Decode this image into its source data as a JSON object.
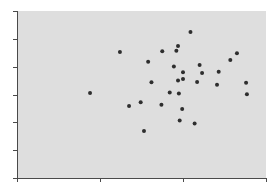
{
  "chart_data": {
    "type": "scatter",
    "title": "",
    "xlabel": "",
    "ylabel": "",
    "xlim": [
      0,
      3
    ],
    "ylim": [
      0,
      6
    ],
    "x_ticks": [
      0,
      1,
      2,
      3
    ],
    "y_ticks": [
      0,
      1,
      2,
      3,
      4,
      5,
      6
    ],
    "x_tick_labels": [],
    "y_tick_labels": [],
    "grid": false,
    "legend": null,
    "colors": {
      "plot_background": "#dedede",
      "axis": "#4a4a4a",
      "marker": "#2e2e2e"
    },
    "series": [
      {
        "name": "points",
        "points": [
          [
            0.88,
            3.05
          ],
          [
            1.24,
            4.53
          ],
          [
            1.35,
            2.59
          ],
          [
            1.49,
            2.72
          ],
          [
            1.53,
            1.69
          ],
          [
            1.58,
            4.18
          ],
          [
            1.62,
            3.44
          ],
          [
            1.74,
            2.63
          ],
          [
            1.75,
            4.55
          ],
          [
            1.84,
            3.07
          ],
          [
            1.89,
            4.01
          ],
          [
            1.92,
            4.57
          ],
          [
            1.94,
            4.74
          ],
          [
            1.94,
            3.5
          ],
          [
            1.95,
            3.04
          ],
          [
            1.96,
            2.07
          ],
          [
            1.99,
            2.48
          ],
          [
            2.0,
            3.8
          ],
          [
            2.0,
            3.56
          ],
          [
            2.09,
            5.25
          ],
          [
            2.14,
            1.96
          ],
          [
            2.17,
            3.45
          ],
          [
            2.2,
            4.06
          ],
          [
            2.23,
            3.77
          ],
          [
            2.41,
            3.35
          ],
          [
            2.43,
            3.82
          ],
          [
            2.57,
            4.24
          ],
          [
            2.65,
            4.48
          ],
          [
            2.76,
            3.42
          ],
          [
            2.77,
            3.01
          ]
        ]
      }
    ]
  }
}
